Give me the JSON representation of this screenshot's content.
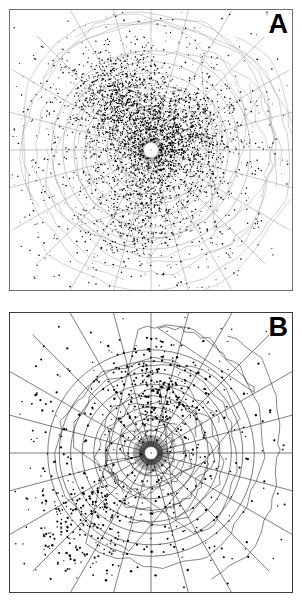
{
  "figure": {
    "width": 302,
    "height": 604,
    "background_color": "#ffffff",
    "panel_count": 2
  },
  "panels": [
    {
      "id": "A",
      "label": "A",
      "projection": "polar azimuthal equidistant",
      "pole": "north",
      "frame_color": "#6d6d6d",
      "graticule_color": "#8d8d8d",
      "coastline_color": "#9a9a9a",
      "point_color": "#000000",
      "center_hole_color": "#ffffff",
      "description": "Dense scatter of event epicenters over a north polar azimuthal graticule"
    },
    {
      "id": "B",
      "label": "B",
      "projection": "polar azimuthal equidistant",
      "pole": "south",
      "frame_color": "#3c3c3c",
      "graticule_color": "#2a2a2a",
      "coastline_color": "#333333",
      "point_color": "#000000",
      "center_hole_color": "#ffffff",
      "description": "Sparse scatter of event epicenters over a south polar azimuthal graticule with radial meridians converging at the pole"
    }
  ],
  "chart_data": {
    "type": "scatter",
    "title": "",
    "subtitle": "",
    "xlabel": "",
    "ylabel": "",
    "grid": true,
    "legend": false,
    "legend_position": "none",
    "panels": [
      {
        "panel": "A",
        "type": "scatter",
        "projection": "azimuthal-equidistant",
        "hemisphere": "north",
        "center_lat": 90,
        "center_lon": 0,
        "lat_range": [
          0,
          90
        ],
        "lon_range": [
          -180,
          180
        ],
        "parallel_spacing_deg": 10,
        "meridian_spacing_deg": 30,
        "parallel_rings": [
          10,
          20,
          30,
          40,
          50,
          60,
          70,
          80,
          90
        ],
        "meridian_lines": [
          -180,
          -150,
          -120,
          -90,
          -60,
          -30,
          0,
          30,
          60,
          90,
          120,
          150
        ],
        "point_count_estimate": 4200,
        "point_radius_px": 0.55,
        "density_clusters": [
          {
            "name": "central-north-cluster",
            "cx": 0.46,
            "cy": 0.38,
            "spread": 0.1,
            "n": 900
          },
          {
            "name": "east-cluster",
            "cx": 0.62,
            "cy": 0.47,
            "spread": 0.09,
            "n": 700
          },
          {
            "name": "northwest-arc",
            "cx": 0.37,
            "cy": 0.3,
            "spread": 0.08,
            "n": 480
          },
          {
            "name": "south-trend",
            "cx": 0.46,
            "cy": 0.7,
            "spread": 0.09,
            "n": 520
          },
          {
            "name": "near-pole-ring",
            "cx": 0.5,
            "cy": 0.5,
            "spread": 0.055,
            "n": 380
          },
          {
            "name": "background-scatter",
            "cx": 0.5,
            "cy": 0.5,
            "spread": 0.3,
            "n": 1220
          }
        ]
      },
      {
        "panel": "B",
        "type": "scatter",
        "projection": "azimuthal-equidistant",
        "hemisphere": "south",
        "center_lat": -90,
        "center_lon": 0,
        "lat_range": [
          -90,
          0
        ],
        "lon_range": [
          -180,
          180
        ],
        "parallel_spacing_deg": 10,
        "meridian_spacing_deg": 15,
        "parallel_rings": [
          -10,
          -20,
          -30,
          -40,
          -50,
          -60,
          -70,
          -80,
          -90
        ],
        "meridian_lines": [
          -180,
          -165,
          -150,
          -135,
          -120,
          -105,
          -90,
          -75,
          -60,
          -45,
          -30,
          -15,
          0,
          15,
          30,
          45,
          60,
          75,
          90,
          105,
          120,
          135,
          150,
          165
        ],
        "point_count_estimate": 900,
        "point_radius_px": 0.8,
        "density_clusters": [
          {
            "name": "andes-belt",
            "cx": 0.53,
            "cy": 0.27,
            "spread": 0.09,
            "n": 230
          },
          {
            "name": "indonesia-belt",
            "cx": 0.28,
            "cy": 0.76,
            "spread": 0.1,
            "n": 210
          },
          {
            "name": "scattered-ocean",
            "cx": 0.5,
            "cy": 0.5,
            "spread": 0.3,
            "n": 460
          }
        ]
      }
    ]
  },
  "annotations": {
    "tick_labels_visible": true,
    "tick_labels_legible": false,
    "tick_label_color": "#8a8a8a",
    "note": "Small degraded graticule tick annotations appear along grid intersections in panel A"
  }
}
